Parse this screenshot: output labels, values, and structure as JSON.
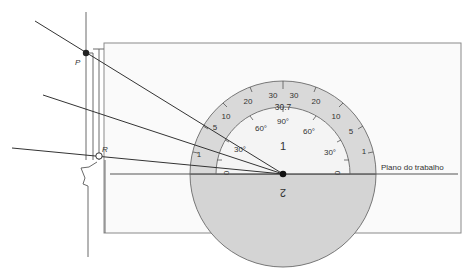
{
  "diagram": {
    "type": "protractor-measurement",
    "points": {
      "P": {
        "label": "P"
      },
      "R": {
        "label": "R"
      }
    },
    "protractor": {
      "region_upper": "1",
      "region_lower": "2",
      "center_reading": "30.7",
      "outer_scale_labels": [
        "1",
        "5",
        "10",
        "20",
        "30",
        "30",
        "20",
        "10",
        "5",
        "1"
      ],
      "inner_scale_labels": [
        "0",
        "30°",
        "60°",
        "90°",
        "60°",
        "30°",
        "0"
      ]
    },
    "work_plane_label": "Plano do trabalho",
    "colors": {
      "protractor_fill": "#d9d9d9",
      "inner_fill": "#f4f4f4",
      "line": "#444444",
      "panel_border": "#8a8a8a"
    }
  }
}
